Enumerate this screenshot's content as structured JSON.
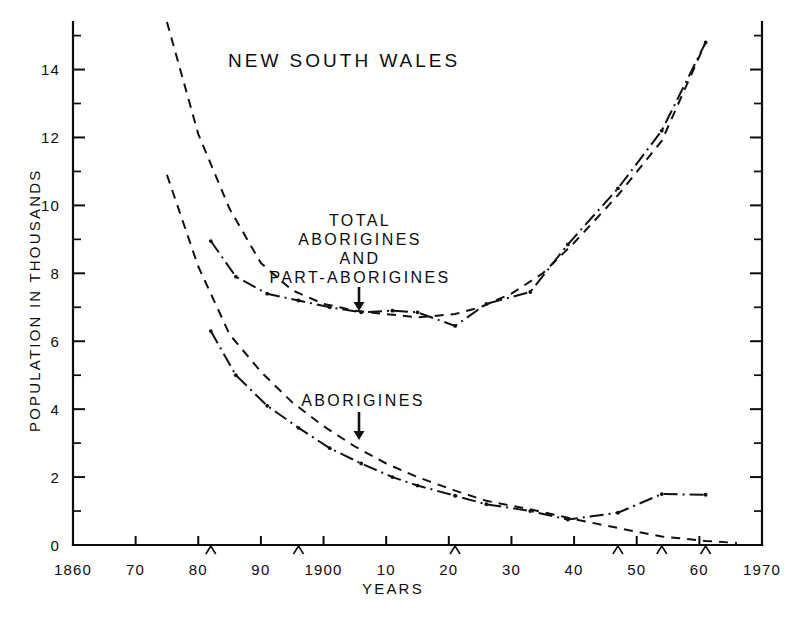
{
  "chart_data": {
    "type": "line",
    "title": "NEW SOUTH WALES",
    "xlabel": "YEARS",
    "ylabel": "POPULATION IN THOUSANDS",
    "xlim": [
      1860,
      1970
    ],
    "ylim": [
      0,
      15.4
    ],
    "grid": false,
    "legend_position": "none",
    "x_ticks_major": [
      1860,
      1870,
      1880,
      1890,
      1900,
      1910,
      1920,
      1930,
      1940,
      1950,
      1960,
      1970
    ],
    "x_tick_labels": [
      "1860",
      "70",
      "80",
      "90",
      "1900",
      "10",
      "20",
      "30",
      "40",
      "50",
      "60",
      "1970"
    ],
    "y_ticks_major": [
      0,
      2,
      4,
      6,
      8,
      10,
      12,
      14
    ],
    "y_tick_labels": [
      "0",
      "2",
      "4",
      "6",
      "8",
      "10",
      "12",
      "14"
    ],
    "y_ticks_minor": [
      1,
      3,
      5,
      7,
      9,
      11,
      13,
      15
    ],
    "census_years": [
      1882,
      1896,
      1921,
      1947,
      1954,
      1961
    ],
    "series": [
      {
        "name": "Total Aborigines and Part-Aborigines (estimated)",
        "style": "dashed",
        "x": [
          1875,
          1880,
          1885,
          1890,
          1895,
          1900,
          1905,
          1910,
          1915,
          1921,
          1925,
          1930,
          1935,
          1940,
          1947,
          1954,
          1961
        ],
        "values": [
          15.4,
          12.1,
          9.9,
          8.3,
          7.5,
          7.1,
          6.9,
          6.8,
          6.7,
          6.8,
          7.0,
          7.4,
          8.0,
          8.9,
          10.3,
          11.9,
          14.8
        ]
      },
      {
        "name": "Total Aborigines and Part-Aborigines (census)",
        "style": "dash-dot",
        "x": [
          1882,
          1886,
          1891,
          1896,
          1901,
          1906,
          1911,
          1915,
          1921,
          1926,
          1933,
          1939,
          1947,
          1954,
          1961
        ],
        "values": [
          8.95,
          7.9,
          7.4,
          7.2,
          7.0,
          6.85,
          6.9,
          6.85,
          6.45,
          7.1,
          7.45,
          8.85,
          10.5,
          12.2,
          14.8
        ]
      },
      {
        "name": "Aborigines (estimated)",
        "style": "dashed",
        "x": [
          1875,
          1880,
          1885,
          1890,
          1895,
          1900,
          1905,
          1910,
          1915,
          1921,
          1926,
          1933,
          1939,
          1947,
          1954,
          1961,
          1966
        ],
        "values": [
          10.9,
          8.2,
          6.2,
          5.1,
          4.2,
          3.5,
          2.9,
          2.4,
          2.0,
          1.6,
          1.3,
          1.05,
          0.8,
          0.5,
          0.25,
          0.12,
          0.06
        ]
      },
      {
        "name": "Aborigines (census)",
        "style": "dash-dot",
        "x": [
          1882,
          1886,
          1891,
          1896,
          1901,
          1906,
          1911,
          1915,
          1921,
          1926,
          1933,
          1939,
          1947,
          1954,
          1961
        ],
        "values": [
          6.3,
          5.0,
          4.1,
          3.45,
          2.85,
          2.4,
          2.0,
          1.75,
          1.45,
          1.2,
          1.0,
          0.75,
          0.95,
          1.5,
          1.48
        ]
      }
    ],
    "annotations": [
      {
        "id": "upper-label",
        "lines": [
          "TOTAL",
          "ABORIGINES",
          "AND",
          "PART-ABORIGINES"
        ],
        "arrow": "down-arrow",
        "points_to_x": 1905,
        "points_to_y": 7.1
      },
      {
        "id": "lower-label",
        "lines": [
          "ABORIGINES"
        ],
        "arrow": "down-arrow",
        "points_to_x": 1905,
        "points_to_y": 2.9
      }
    ]
  }
}
